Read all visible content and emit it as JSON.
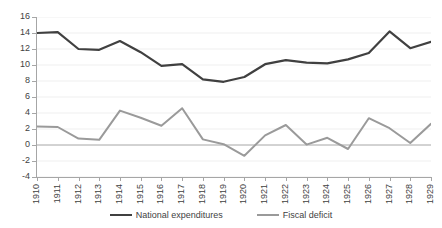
{
  "chart_data": {
    "type": "line",
    "title": "",
    "subtitle": "",
    "xlabel": "",
    "ylabel": "",
    "grid": true,
    "legend_position": "bottom",
    "ylim": [
      -4,
      16
    ],
    "ytick_step": 2,
    "yticks": [
      "16",
      "14",
      "12",
      "10",
      "8",
      "6",
      "4",
      "2",
      "0",
      "-2",
      "-4"
    ],
    "ytick_values": [
      16,
      14,
      12,
      10,
      8,
      6,
      4,
      2,
      0,
      -2,
      -4
    ],
    "categories": [
      "1910",
      "1911",
      "1912",
      "1913",
      "1914",
      "1915",
      "1916",
      "1917",
      "1918",
      "1919",
      "1920",
      "1921",
      "1922",
      "1923",
      "1924",
      "1925",
      "1926",
      "1927",
      "1928",
      "1929"
    ],
    "x": [
      1910,
      1911,
      1912,
      1913,
      1914,
      1915,
      1916,
      1917,
      1918,
      1919,
      1920,
      1921,
      1922,
      1923,
      1924,
      1925,
      1926,
      1927,
      1928,
      1929
    ],
    "series": [
      {
        "name": "National expenditures",
        "color": "#404040",
        "width": 2.2,
        "values": [
          14.0,
          14.1,
          12.0,
          11.9,
          13.0,
          11.6,
          9.9,
          10.1,
          8.2,
          7.9,
          8.5,
          10.1,
          10.6,
          10.3,
          10.2,
          10.7,
          11.5,
          14.2,
          12.1,
          12.9
        ]
      },
      {
        "name": "Fiscal deficit",
        "color": "#9a9a9a",
        "width": 2.0,
        "values": [
          2.3,
          2.25,
          0.8,
          0.65,
          4.3,
          3.4,
          2.4,
          4.6,
          0.7,
          0.1,
          -1.35,
          1.2,
          2.5,
          0.05,
          0.9,
          -0.5,
          3.35,
          2.1,
          0.25,
          2.65
        ]
      }
    ],
    "legend": [
      {
        "label": "National expenditures",
        "color": "#404040"
      },
      {
        "label": "Fiscal deficit",
        "color": "#9a9a9a"
      }
    ],
    "axis_color": "#a6a6a6",
    "gridline_color": "#efefef",
    "zero_line_color": "#a6a6a6",
    "background": "#ffffff"
  }
}
